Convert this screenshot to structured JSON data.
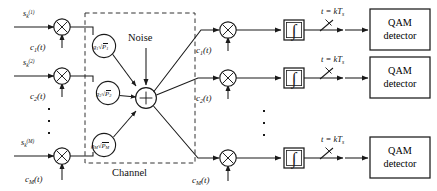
{
  "diagram": {
    "channel_label": "Channel",
    "noise_label": "Noise",
    "ellipsis_icon": "vertical-ellipsis",
    "multiplier_glyph": "×",
    "summer_glyph": "+",
    "integrator_glyph": "∫",
    "colors": {
      "line": "#1a1a1a",
      "dashed": "#333333",
      "background": "#ffffff",
      "text": "#111111"
    },
    "transmitter": {
      "branches": [
        {
          "input_symbol": "s",
          "input_sub": "k",
          "input_sup": "(1)",
          "carrier_name": "c",
          "carrier_sub": "1",
          "carrier_arg": "(t)",
          "gain_symbol": "g",
          "gain_sub": "1",
          "power_symbol": "P",
          "power_sub": "1"
        },
        {
          "input_symbol": "s",
          "input_sub": "k",
          "input_sup": "(2)",
          "carrier_name": "c",
          "carrier_sub": "2",
          "carrier_arg": "(t)",
          "gain_symbol": "g",
          "gain_sub": "2",
          "power_symbol": "P",
          "power_sub": "2"
        },
        {
          "input_symbol": "s",
          "input_sub": "k",
          "input_sup": "(M)",
          "carrier_name": "c",
          "carrier_sub": "M",
          "carrier_arg": "(t)",
          "gain_symbol": "g",
          "gain_sub": "M",
          "power_symbol": "P",
          "power_sub": "M"
        }
      ]
    },
    "receiver": {
      "branches": [
        {
          "carrier_name": "c",
          "carrier_sub": "1",
          "carrier_arg": "(t)",
          "sample_label": "t = kT",
          "sample_sub": "s",
          "detector_line1": "QAM",
          "detector_line2": "detector"
        },
        {
          "carrier_name": "c",
          "carrier_sub": "2",
          "carrier_arg": "(t)",
          "sample_label": "t = kT",
          "sample_sub": "s",
          "detector_line1": "QAM",
          "detector_line2": "detector"
        },
        {
          "carrier_name": "c",
          "carrier_sub": "M",
          "carrier_arg": "(t)",
          "sample_label": "t = kT",
          "sample_sub": "s",
          "detector_line1": "QAM",
          "detector_line2": "detector"
        }
      ]
    }
  }
}
